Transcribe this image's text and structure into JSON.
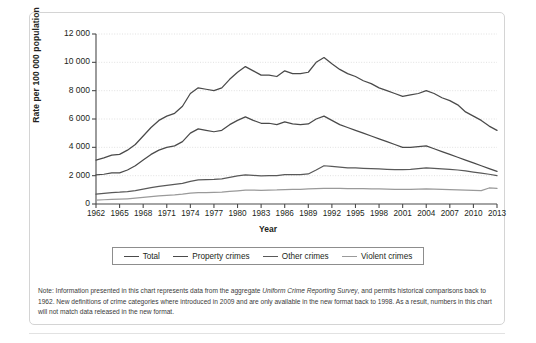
{
  "chart_data": {
    "type": "line",
    "title": "",
    "xlabel": "Year",
    "ylabel": "Rate per 100 000 population",
    "xlim": [
      1962,
      2013
    ],
    "ylim": [
      0,
      12000
    ],
    "ytick_labels": [
      "12 000",
      "10 000",
      "8 000",
      "6 000",
      "4 000",
      "2 000",
      "0"
    ],
    "ytick_values": [
      12000,
      10000,
      8000,
      6000,
      4000,
      2000,
      0
    ],
    "xtick_labels": [
      "1962",
      "1965",
      "1968",
      "1971",
      "1974",
      "1977",
      "1980",
      "1983",
      "1986",
      "1989",
      "1992",
      "1995",
      "1998",
      "2001",
      "2004",
      "2007",
      "2010",
      "2013"
    ],
    "xtick_values": [
      1962,
      1965,
      1968,
      1971,
      1974,
      1977,
      1980,
      1983,
      1986,
      1989,
      1992,
      1995,
      1998,
      2001,
      2004,
      2007,
      2010,
      2013
    ],
    "grid": true,
    "legend_position": "below-axes",
    "x": [
      1962,
      1963,
      1964,
      1965,
      1966,
      1967,
      1968,
      1969,
      1970,
      1971,
      1972,
      1973,
      1974,
      1975,
      1976,
      1977,
      1978,
      1979,
      1980,
      1981,
      1982,
      1983,
      1984,
      1985,
      1986,
      1987,
      1988,
      1989,
      1990,
      1991,
      1992,
      1993,
      1994,
      1995,
      1996,
      1997,
      1998,
      1999,
      2000,
      2001,
      2002,
      2003,
      2004,
      2005,
      2006,
      2007,
      2008,
      2009,
      2010,
      2011,
      2012,
      2013
    ],
    "series": [
      {
        "name": "Total",
        "color": "#4a4a4a",
        "values": [
          3100,
          3250,
          3450,
          3500,
          3800,
          4200,
          4800,
          5400,
          5900,
          6200,
          6400,
          6900,
          7800,
          8200,
          8100,
          8000,
          8200,
          8800,
          9300,
          9700,
          9400,
          9100,
          9100,
          9000,
          9400,
          9200,
          9200,
          9300,
          10000,
          10340,
          9900,
          9500,
          9200,
          9000,
          8700,
          8500,
          8200,
          8000,
          7800,
          7600,
          7700,
          7800,
          8000,
          7800,
          7500,
          7300,
          7000,
          6500,
          6200,
          5900,
          5500,
          5200
        ]
      },
      {
        "name": "Property crimes",
        "color": "#4a4a4a",
        "values": [
          2050,
          2100,
          2200,
          2200,
          2400,
          2700,
          3100,
          3500,
          3800,
          4000,
          4100,
          4400,
          5000,
          5300,
          5200,
          5100,
          5200,
          5600,
          5900,
          6150,
          5900,
          5700,
          5700,
          5600,
          5800,
          5650,
          5600,
          5650,
          6000,
          6200,
          5900,
          5600,
          5400,
          5200,
          5000,
          4800,
          4600,
          4400,
          4200,
          4000,
          4000,
          4050,
          4100,
          3900,
          3700,
          3500,
          3300,
          3100,
          2900,
          2700,
          2500,
          2300
        ]
      },
      {
        "name": "Other crimes",
        "color": "#595959",
        "values": [
          700,
          750,
          800,
          830,
          880,
          950,
          1050,
          1150,
          1250,
          1320,
          1380,
          1450,
          1600,
          1700,
          1720,
          1740,
          1780,
          1880,
          1980,
          2050,
          2020,
          1990,
          2000,
          2000,
          2080,
          2070,
          2080,
          2120,
          2400,
          2700,
          2650,
          2600,
          2550,
          2550,
          2520,
          2500,
          2480,
          2450,
          2430,
          2420,
          2450,
          2500,
          2550,
          2520,
          2480,
          2450,
          2400,
          2330,
          2250,
          2180,
          2100,
          2000
        ]
      },
      {
        "name": "Violent crimes",
        "color": "#9a9a9a",
        "values": [
          280,
          300,
          320,
          340,
          370,
          410,
          460,
          520,
          570,
          610,
          640,
          690,
          760,
          800,
          810,
          820,
          840,
          890,
          930,
          980,
          980,
          970,
          980,
          990,
          1020,
          1030,
          1040,
          1060,
          1080,
          1100,
          1110,
          1100,
          1090,
          1090,
          1080,
          1070,
          1060,
          1050,
          1040,
          1030,
          1040,
          1050,
          1060,
          1050,
          1030,
          1010,
          1000,
          980,
          960,
          940,
          1130,
          1100
        ]
      }
    ],
    "note": {
      "line1_before_italic": "Note: Information presented in this chart represents data from the aggregate ",
      "italic": "Uniform Crime Reporting Survey",
      "line1_after_italic": ", and permits historical comparisons back to 1962. New definitions of crime categories where introduced in 2009 and are only available in the new format back to 1998. As a result, numbers in this chart will not match data released in the new format."
    }
  }
}
